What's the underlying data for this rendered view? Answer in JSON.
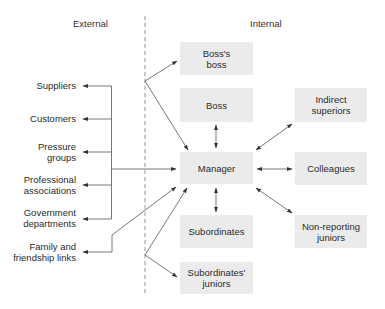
{
  "diagram": {
    "type": "relationship-map",
    "headings": {
      "external": "External",
      "internal": "Internal"
    },
    "colors": {
      "box_fill": "#ebebeb",
      "line": "#555555",
      "text": "#2b2b2b",
      "divider": "#888888"
    },
    "internal_nodes": {
      "boss_boss": [
        "Boss's",
        "boss"
      ],
      "boss": [
        "Boss"
      ],
      "manager": [
        "Manager"
      ],
      "subordinates": [
        "Subordinates"
      ],
      "subordinates_juniors": [
        "Subordinates'",
        "juniors"
      ],
      "indirect_superiors": [
        "Indirect",
        "superiors"
      ],
      "colleagues": [
        "Colleagues"
      ],
      "non_reporting_juniors": [
        "Non-reporting",
        "juniors"
      ]
    },
    "external_nodes": {
      "suppliers": [
        "Suppliers"
      ],
      "customers": [
        "Customers"
      ],
      "pressure_groups": [
        "Pressure",
        "groups"
      ],
      "professional_associations": [
        "Professional",
        "associations"
      ],
      "government_departments": [
        "Government",
        "departments"
      ],
      "family_links": [
        "Family and",
        "friendship links"
      ]
    },
    "edges": [
      {
        "from": "Manager",
        "to": "Suppliers",
        "direction": "to"
      },
      {
        "from": "Manager",
        "to": "Customers",
        "direction": "to"
      },
      {
        "from": "Manager",
        "to": "Pressure groups",
        "direction": "to"
      },
      {
        "from": "Manager",
        "to": "Professional associations",
        "direction": "to"
      },
      {
        "from": "Manager",
        "to": "Government departments",
        "direction": "to"
      },
      {
        "from": "Manager",
        "to": "Family and friendship links",
        "direction": "both"
      },
      {
        "from": "Manager",
        "to": "Boss",
        "direction": "both"
      },
      {
        "from": "Manager",
        "to": "Subordinates",
        "direction": "both"
      },
      {
        "from": "Manager",
        "to": "Indirect superiors",
        "direction": "both"
      },
      {
        "from": "Manager",
        "to": "Colleagues",
        "direction": "both"
      },
      {
        "from": "Manager",
        "to": "Non-reporting juniors",
        "direction": "both"
      },
      {
        "from": "Boss's boss",
        "to": "Manager",
        "direction": "both"
      },
      {
        "from": "Subordinates' juniors",
        "to": "Manager",
        "direction": "both"
      }
    ]
  }
}
